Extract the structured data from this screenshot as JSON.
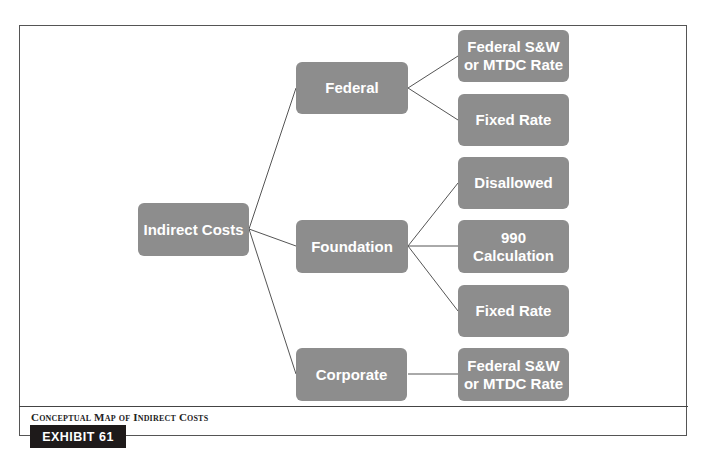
{
  "diagram": {
    "root": {
      "label": "Indirect Costs"
    },
    "categories": [
      {
        "label": "Federal",
        "children": [
          {
            "label": "Federal S&W\nor MTDC Rate"
          },
          {
            "label": "Fixed Rate"
          }
        ]
      },
      {
        "label": "Foundation",
        "children": [
          {
            "label": "Disallowed"
          },
          {
            "label": "990\nCalculation"
          },
          {
            "label": "Fixed Rate"
          }
        ]
      },
      {
        "label": "Corporate",
        "children": [
          {
            "label": "Federal S&W\nor MTDC Rate"
          }
        ]
      }
    ],
    "colors": {
      "node_fill": "#8d8d8d",
      "node_text": "#ffffff",
      "connector": "#555555"
    }
  },
  "caption": {
    "title": "Conceptual Map of Indirect Costs",
    "exhibit_label": "EXHIBIT 61"
  }
}
